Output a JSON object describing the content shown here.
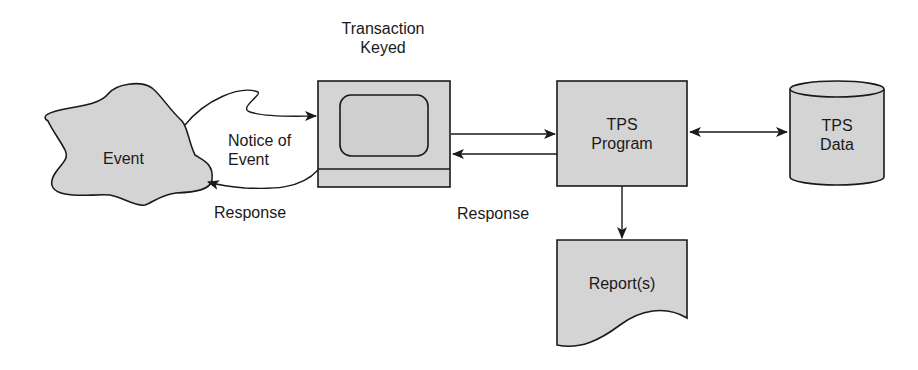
{
  "diagram": {
    "nodes": {
      "event": {
        "label": "Event"
      },
      "terminal": {
        "label_line1": "Transaction",
        "label_line2": "Keyed"
      },
      "tps_program": {
        "label_line1": "TPS",
        "label_line2": "Program"
      },
      "tps_data": {
        "label_line1": "TPS",
        "label_line2": "Data"
      },
      "reports": {
        "label": "Report(s)"
      }
    },
    "edges": {
      "notice": {
        "label_line1": "Notice of",
        "label_line2": "Event"
      },
      "response_event": {
        "label": "Response"
      },
      "response_program": {
        "label": "Response"
      }
    },
    "colors": {
      "fill": "#d4d4d4",
      "stroke": "#1a1a1a",
      "background": "#ffffff"
    }
  }
}
